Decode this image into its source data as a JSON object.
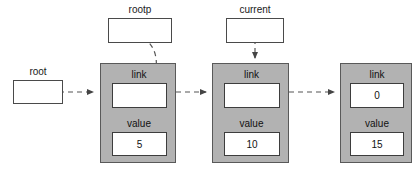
{
  "diagram": {
    "type": "linked-list",
    "background_color": "#ffffff",
    "node_fill_color": "#b2b2b2",
    "node_border_color": "#595959",
    "field_fill_color": "#ffffff",
    "connector_style": "dashed",
    "connector_color": "#555555"
  },
  "pointers": [
    {
      "id": "root",
      "label": "root",
      "value": "",
      "points_to": "node-1",
      "arrow_style": "straight-horizontal"
    },
    {
      "id": "rootp",
      "label": "rootp",
      "value": "",
      "points_to": "node-1-link",
      "arrow_style": "curved"
    },
    {
      "id": "current",
      "label": "current",
      "value": "",
      "points_to": "node-2",
      "arrow_style": "straight-vertical"
    }
  ],
  "nodes": [
    {
      "id": "node-1",
      "link_label": "link",
      "link_value": "",
      "value_label": "value",
      "value_value": "5"
    },
    {
      "id": "node-2",
      "link_label": "link",
      "link_value": "",
      "value_label": "value",
      "value_value": "10"
    },
    {
      "id": "node-3",
      "link_label": "link",
      "link_value": "0",
      "value_label": "value",
      "value_value": "15"
    }
  ],
  "edges": [
    {
      "from": "root",
      "to": "node-1"
    },
    {
      "from": "rootp",
      "to": "node-1-link"
    },
    {
      "from": "current",
      "to": "node-2"
    },
    {
      "from": "node-1-link",
      "to": "node-2"
    },
    {
      "from": "node-2-link",
      "to": "node-3"
    }
  ]
}
